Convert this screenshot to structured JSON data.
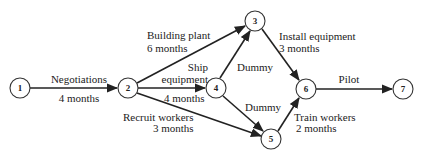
{
  "diagram": {
    "type": "activity-network",
    "colors": {
      "line": "#222222",
      "node_fill": "#ffffff",
      "text": "#222222"
    },
    "nodes": [
      {
        "id": "1",
        "label": "1",
        "x": 20,
        "y": 88
      },
      {
        "id": "2",
        "label": "2",
        "x": 128,
        "y": 88
      },
      {
        "id": "3",
        "label": "3",
        "x": 255,
        "y": 21
      },
      {
        "id": "4",
        "label": "4",
        "x": 216,
        "y": 88
      },
      {
        "id": "5",
        "label": "5",
        "x": 271,
        "y": 139
      },
      {
        "id": "6",
        "label": "6",
        "x": 306,
        "y": 89
      },
      {
        "id": "7",
        "label": "7",
        "x": 403,
        "y": 89
      }
    ],
    "edges": [
      {
        "from": "1",
        "to": "2",
        "activity": "Negotiations",
        "duration": "4 months"
      },
      {
        "from": "2",
        "to": "3",
        "activity": "Building plant",
        "duration": "6 months"
      },
      {
        "from": "2",
        "to": "4",
        "activity_line1": "Ship",
        "activity_line2": "equipment",
        "duration": "4 months"
      },
      {
        "from": "2",
        "to": "5",
        "activity": "Recruit workers",
        "duration": "3 months"
      },
      {
        "from": "4",
        "to": "3",
        "activity": "Dummy"
      },
      {
        "from": "4",
        "to": "5",
        "activity": "Dummy"
      },
      {
        "from": "3",
        "to": "6",
        "activity": "Install equipment",
        "duration": "3 months"
      },
      {
        "from": "5",
        "to": "6",
        "activity": "Train workers",
        "duration": "2 months"
      },
      {
        "from": "6",
        "to": "7",
        "activity": "Pilot"
      }
    ]
  }
}
